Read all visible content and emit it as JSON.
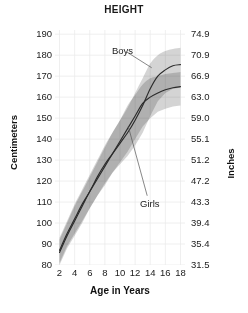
{
  "chart_data": {
    "type": "line",
    "title": "HEIGHT",
    "xlabel": "Age in Years",
    "ylabel": "Centimeters",
    "ylabel_secondary": "Inches",
    "xlim": [
      1.4,
      18.6
    ],
    "ylim": [
      80,
      192
    ],
    "grid": true,
    "legend_position": "inline-annotations",
    "xticks": [
      2,
      4,
      6,
      8,
      10,
      12,
      14,
      16,
      18
    ],
    "xticklabels": [
      "2",
      "4",
      "6",
      "8",
      "10",
      "12",
      "14",
      "16",
      "18"
    ],
    "yticks": [
      80,
      90,
      100,
      110,
      120,
      130,
      140,
      150,
      160,
      170,
      180,
      190
    ],
    "yticklabels": [
      "80",
      "90",
      "100",
      "110",
      "120",
      "130",
      "140",
      "150",
      "160",
      "170",
      "180",
      "190"
    ],
    "yticks_secondary": [
      31.5,
      35.4,
      39.4,
      43.3,
      47.2,
      51.2,
      55.1,
      59.0,
      63.0,
      66.9,
      70.9,
      74.9
    ],
    "yticklabels_secondary": [
      "31.5",
      "35.4",
      "39.4",
      "43.3",
      "47.2",
      "51.2",
      "55.1",
      "59.0",
      "63.0",
      "66.9",
      "70.9",
      "74.9"
    ],
    "x": [
      2,
      3,
      4,
      5,
      6,
      7,
      8,
      9,
      10,
      11,
      12,
      13,
      14,
      15,
      16,
      17,
      18
    ],
    "series": [
      {
        "name": "Boys",
        "label": "Boys",
        "color": "#2b2b2b",
        "values": [
          87,
          95,
          102,
          109,
          115,
          122,
          128,
          133,
          138,
          143,
          149,
          156,
          164,
          170,
          173,
          175,
          175.5
        ],
        "band_upper": [
          93,
          101,
          109,
          116,
          123,
          130,
          137,
          143,
          149,
          155,
          162,
          169,
          176,
          180,
          182,
          183,
          183.5
        ],
        "band_lower": [
          81,
          89,
          95,
          101,
          107,
          113,
          119,
          124,
          128,
          132,
          137,
          143,
          151,
          158,
          162,
          164,
          164.5
        ]
      },
      {
        "name": "Girls",
        "label": "Girls",
        "color": "#2b2b2b",
        "values": [
          86,
          94,
          101,
          108,
          115,
          121,
          127,
          133,
          139,
          145,
          151,
          157,
          160,
          162,
          163.5,
          164.5,
          165
        ],
        "band_upper": [
          92,
          100,
          108,
          115,
          122,
          129,
          136,
          143,
          149,
          156,
          161,
          166,
          169,
          170,
          171,
          171.5,
          172
        ],
        "band_lower": [
          80,
          88,
          94,
          100,
          107,
          113,
          118,
          124,
          129,
          134,
          140,
          146,
          150,
          153,
          154.5,
          155.5,
          156
        ]
      }
    ],
    "annotations": [
      {
        "text": "Boys",
        "target_x": 14.2,
        "target_y": 174
      },
      {
        "text": "Girls",
        "target_x": 11.1,
        "target_y": 146
      }
    ]
  },
  "colors": {
    "band_fill": "#b9b9b9",
    "band_fill_overlap": "#9e9e9e",
    "curve": "#2b2b2b",
    "grid": "#e8e8e8",
    "text": "#1a1a1a"
  }
}
